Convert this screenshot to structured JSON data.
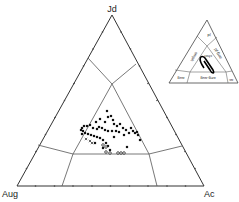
{
  "diagram": {
    "type": "ternary",
    "vertices": {
      "top": "Jd",
      "bottom_left": "Aug",
      "bottom_right": "Ac"
    },
    "inset": {
      "fields": {
        "jd": "jd",
        "omph": "omph",
        "aeg_jd": "aeg-jd",
        "chor": "chor",
        "aug": "aug",
        "aeg_aug": "aeg-aug",
        "ac": "ac"
      }
    }
  },
  "chart_data": {
    "type": "scatter",
    "title": "",
    "plot_kind": "ternary",
    "axes": [
      "Jd",
      "Aug",
      "Ac"
    ],
    "field_labels_inset": [
      "jd",
      "omph",
      "aeg-jd",
      "chor",
      "aug",
      "aeg-aug",
      "ac"
    ],
    "points_px_solid": [
      [
        107,
        111
      ],
      [
        108,
        117
      ],
      [
        111,
        116
      ],
      [
        113,
        120
      ],
      [
        114,
        124
      ],
      [
        117,
        126
      ],
      [
        100,
        119
      ],
      [
        96,
        122
      ],
      [
        105,
        122
      ],
      [
        120,
        124
      ],
      [
        123,
        128
      ],
      [
        126,
        130
      ],
      [
        129,
        133
      ],
      [
        133,
        131
      ],
      [
        135,
        133
      ],
      [
        137,
        132
      ],
      [
        138,
        135
      ],
      [
        140,
        140
      ],
      [
        119,
        132
      ],
      [
        116,
        131
      ],
      [
        112,
        131
      ],
      [
        108,
        131
      ],
      [
        105,
        130
      ],
      [
        102,
        128
      ],
      [
        99,
        127
      ],
      [
        97,
        129
      ],
      [
        93,
        128
      ],
      [
        90,
        125
      ],
      [
        87,
        126
      ],
      [
        84,
        126
      ],
      [
        82,
        128
      ],
      [
        83,
        131
      ],
      [
        85,
        133
      ],
      [
        88,
        134
      ],
      [
        91,
        135
      ],
      [
        94,
        136
      ],
      [
        97,
        137
      ],
      [
        100,
        138
      ],
      [
        103,
        140
      ],
      [
        106,
        143
      ],
      [
        108,
        146
      ],
      [
        110,
        150
      ],
      [
        95,
        143
      ],
      [
        103,
        148
      ],
      [
        82,
        134
      ],
      [
        81,
        130
      ],
      [
        127,
        147
      ],
      [
        131,
        128
      ],
      [
        124,
        135
      ],
      [
        114,
        137
      ]
    ],
    "points_px_open": [
      [
        106,
        152
      ],
      [
        110,
        153
      ],
      [
        118,
        153
      ],
      [
        121,
        153
      ],
      [
        124,
        153
      ],
      [
        106,
        147
      ],
      [
        103,
        145
      ]
    ],
    "points_px_cross": [
      [
        86,
        139
      ],
      [
        90,
        141
      ],
      [
        92,
        143
      ]
    ],
    "legend": []
  }
}
